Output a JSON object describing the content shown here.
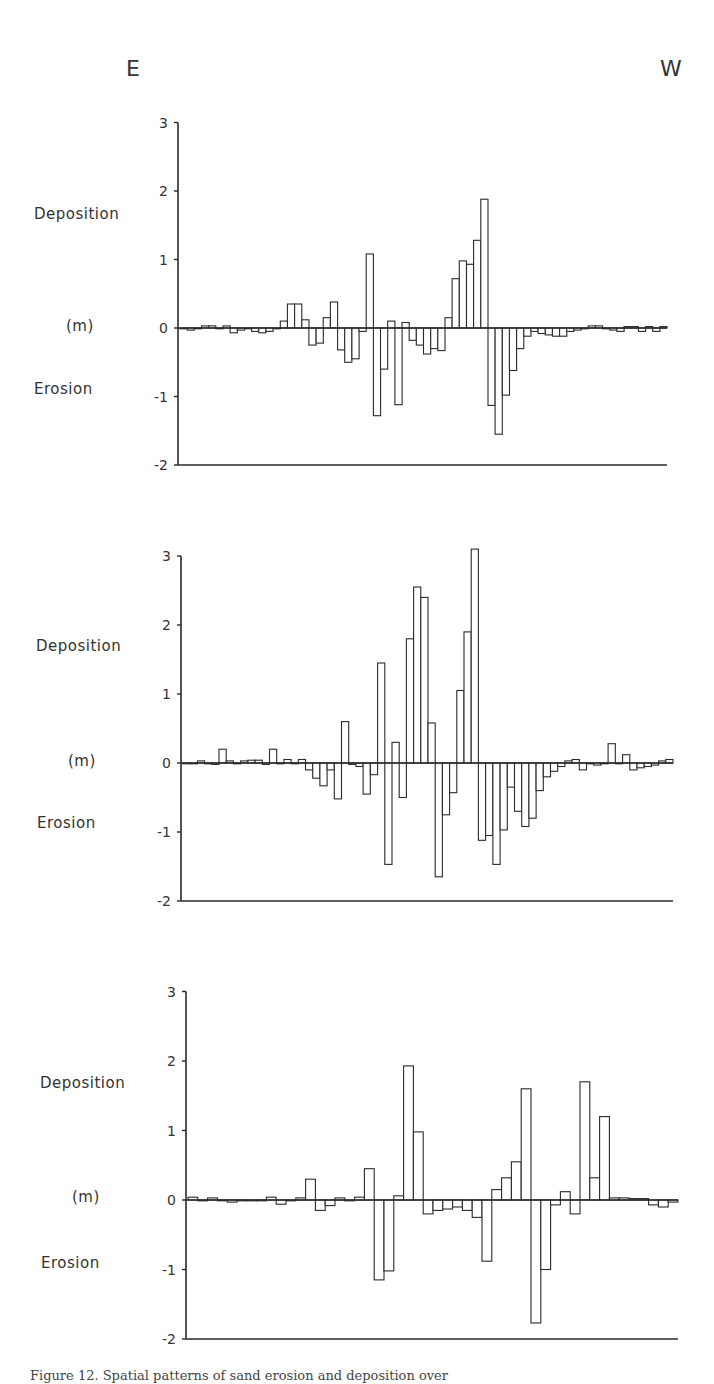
{
  "header": {
    "left_direction": "E",
    "right_direction": "W"
  },
  "labels": {
    "deposition": "Deposition",
    "unit": "(m)",
    "erosion": "Erosion"
  },
  "caption": "Figure 12.  Spatial patterns of sand erosion and deposition over",
  "chart_data": [
    {
      "type": "bar",
      "title": "",
      "xlabel": "E → W",
      "ylabel": "Deposition / Erosion (m)",
      "ylim": [
        -2,
        3
      ],
      "yticks": [
        "3",
        "2",
        "1",
        "0",
        "-1",
        "-2"
      ],
      "grid": false,
      "values": [
        0,
        -0.03,
        0,
        0.03,
        0.03,
        0,
        0.03,
        -0.07,
        -0.03,
        0,
        -0.05,
        -0.07,
        -0.05,
        0,
        0.1,
        0.35,
        0.35,
        0.12,
        -0.25,
        -0.22,
        0.15,
        0.38,
        -0.32,
        -0.5,
        -0.45,
        -0.05,
        1.08,
        -1.28,
        -0.6,
        0.1,
        -1.12,
        0.08,
        -0.18,
        -0.25,
        -0.38,
        -0.3,
        -0.33,
        0.15,
        0.72,
        0.98,
        0.93,
        1.28,
        1.88,
        -1.13,
        -1.55,
        -0.98,
        -0.62,
        -0.3,
        -0.12,
        -0.05,
        -0.08,
        -0.1,
        -0.12,
        -0.12,
        -0.05,
        -0.03,
        0,
        0.03,
        0.03,
        0,
        -0.03,
        -0.05,
        0.02,
        0.02,
        -0.05,
        0.02,
        -0.05,
        0.02
      ]
    },
    {
      "type": "bar",
      "title": "",
      "xlabel": "E → W",
      "ylabel": "Deposition / Erosion (m)",
      "ylim": [
        -2,
        3
      ],
      "yticks": [
        "3",
        "2",
        "1",
        "0",
        "-1",
        "-2"
      ],
      "grid": false,
      "values": [
        0,
        0,
        0.03,
        0,
        -0.02,
        0.2,
        0.03,
        0,
        0.03,
        0.04,
        0.04,
        -0.02,
        0.2,
        0,
        0.05,
        0,
        0.05,
        -0.1,
        -0.22,
        -0.33,
        -0.1,
        -0.52,
        0.6,
        -0.02,
        -0.05,
        -0.45,
        -0.17,
        1.45,
        -1.47,
        0.3,
        -0.5,
        1.8,
        2.55,
        2.4,
        0.58,
        -1.65,
        -0.75,
        -0.43,
        1.05,
        1.9,
        3.1,
        -1.12,
        -1.05,
        -1.47,
        -0.97,
        -0.35,
        -0.7,
        -0.92,
        -0.8,
        -0.4,
        -0.2,
        -0.12,
        -0.05,
        0.03,
        0.05,
        -0.1,
        0,
        -0.03,
        0,
        0.28,
        0,
        0.12,
        -0.1,
        -0.07,
        -0.05,
        -0.03,
        0.03,
        0.05
      ]
    },
    {
      "type": "bar",
      "title": "",
      "xlabel": "E → W",
      "ylabel": "Deposition / Erosion (m)",
      "ylim": [
        -2,
        3
      ],
      "yticks": [
        "3",
        "2",
        "1",
        "0",
        "-1",
        "-2"
      ],
      "grid": false,
      "values": [
        0.04,
        0,
        0.03,
        0,
        -0.03,
        0,
        0,
        0,
        0.04,
        -0.06,
        0,
        0.03,
        0.3,
        -0.15,
        -0.08,
        0.03,
        0,
        0.04,
        0.45,
        -1.15,
        -1.02,
        0.06,
        1.93,
        0.98,
        -0.2,
        -0.15,
        -0.13,
        -0.1,
        -0.15,
        -0.25,
        -0.88,
        0.15,
        0.32,
        0.55,
        1.6,
        -1.77,
        -1.0,
        -0.07,
        0.12,
        -0.2,
        1.7,
        0.32,
        1.2,
        0.03,
        0.03,
        0.02,
        0.02,
        -0.07,
        -0.1,
        -0.03
      ]
    }
  ]
}
